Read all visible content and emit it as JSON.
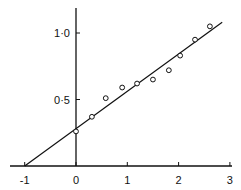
{
  "chart_data": {
    "type": "scatter",
    "title": "",
    "xlabel": "",
    "ylabel": "",
    "xlim": [
      -1.1,
      3.0
    ],
    "ylim": [
      0,
      1.2
    ],
    "grid": false,
    "legend": null,
    "x_ticks": [
      -1,
      0,
      1,
      2,
      3
    ],
    "x_tick_labels": [
      "-1",
      "0",
      "1",
      "2",
      "3"
    ],
    "y_ticks": [
      0.5,
      1.0
    ],
    "y_tick_labels": [
      "0·5",
      "1·0"
    ],
    "series": [
      {
        "name": "observed",
        "marker": "open-circle",
        "x": [
          0.0,
          0.31,
          0.58,
          0.9,
          1.19,
          1.5,
          1.81,
          2.03,
          2.32,
          2.61
        ],
        "y": [
          0.26,
          0.37,
          0.51,
          0.59,
          0.62,
          0.65,
          0.72,
          0.83,
          0.95,
          1.05
        ]
      },
      {
        "name": "fitted line",
        "type": "line",
        "x": [
          -1.0,
          2.85
        ],
        "y": [
          0.0,
          1.08
        ]
      }
    ]
  },
  "colors": {
    "ink": "#111111",
    "background": "#ffffff"
  }
}
